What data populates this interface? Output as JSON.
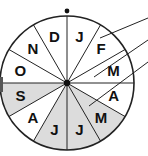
{
  "diagram": {
    "type": "month-wheel",
    "center": [
      67,
      83
    ],
    "radius": 67,
    "shade_color": "#dcdcdc",
    "line_color": "#222222",
    "months": [
      {
        "label": "J",
        "shaded": false
      },
      {
        "label": "F",
        "shaded": false
      },
      {
        "label": "M",
        "shaded": false
      },
      {
        "label": "A",
        "shaded": false
      },
      {
        "label": "M",
        "shaded": true
      },
      {
        "label": "J",
        "shaded": true
      },
      {
        "label": "J",
        "shaded": true
      },
      {
        "label": "A",
        "shaded": false
      },
      {
        "label": "S",
        "shaded": true
      },
      {
        "label": "O",
        "shaded": false
      },
      {
        "label": "N",
        "shaded": false
      },
      {
        "label": "D",
        "shaded": false
      }
    ],
    "pointer_lines": [
      {
        "from": [
          100,
          38
        ],
        "to": [
          148,
          18
        ]
      },
      {
        "from": [
          94,
          77
        ],
        "to": [
          148,
          40
        ]
      },
      {
        "from": [
          89,
          106
        ],
        "to": [
          148,
          62
        ]
      }
    ],
    "top_marker": "dot"
  }
}
